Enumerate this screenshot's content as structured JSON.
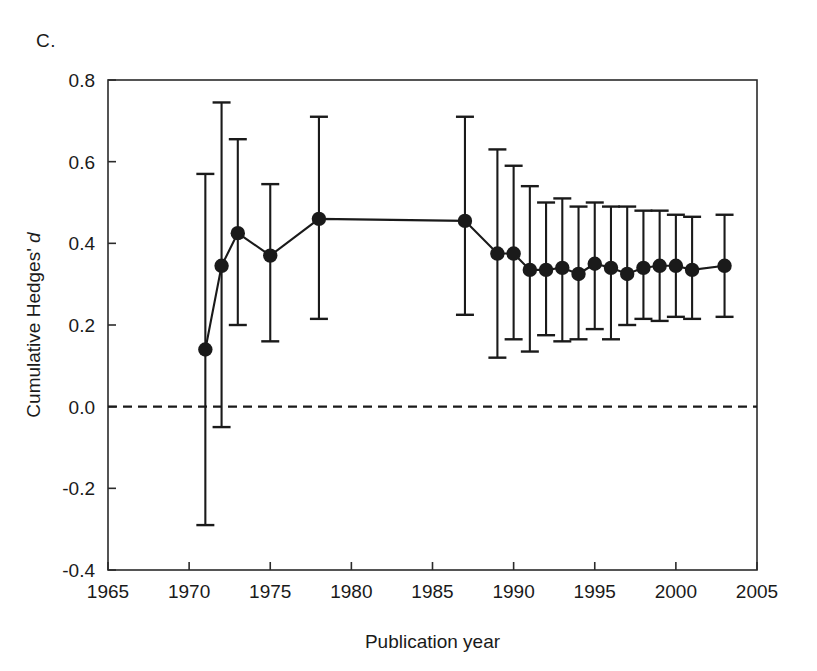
{
  "panel": {
    "label": "C."
  },
  "chart_data": {
    "type": "line",
    "title": "",
    "subtitle": "",
    "xlabel": "Publication year",
    "ylabel": "Cumulative Hedges' d",
    "ylabel_parts": {
      "plain": "Cumulative Hedges'",
      "italic": "d"
    },
    "xlim": [
      1965,
      2005
    ],
    "ylim": [
      -0.4,
      0.8
    ],
    "xticks": [
      1965,
      1970,
      1975,
      1980,
      1985,
      1990,
      1995,
      2000,
      2005
    ],
    "xtick_labels": [
      "1965",
      "1970",
      "1975",
      "1980",
      "1985",
      "1990",
      "1995",
      "2000",
      "2005"
    ],
    "yticks": [
      -0.4,
      -0.2,
      0.0,
      0.2,
      0.4,
      0.6,
      0.8
    ],
    "ytick_labels": [
      "-0.4",
      "-0.2",
      "0.0",
      "0.2",
      "0.4",
      "0.6",
      "0.8"
    ],
    "grid": false,
    "legend": null,
    "reference_line": {
      "y": 0.0,
      "style": "dashed",
      "color": "#1a1a1a"
    },
    "marker": "filled-circle",
    "error_bars": "95% confidence interval",
    "series": [
      {
        "name": "Cumulative Hedges' d",
        "color": "#1a1a1a",
        "x": [
          1971,
          1972,
          1973,
          1975,
          1978,
          1987,
          1989,
          1990,
          1991,
          1992,
          1993,
          1994,
          1995,
          1996,
          1997,
          1998,
          1999,
          2000,
          2001,
          2003
        ],
        "values": [
          0.14,
          0.345,
          0.425,
          0.37,
          0.46,
          0.455,
          0.375,
          0.375,
          0.335,
          0.335,
          0.34,
          0.325,
          0.35,
          0.34,
          0.325,
          0.34,
          0.345,
          0.345,
          0.335,
          0.345
        ],
        "ci_lower": [
          -0.29,
          -0.05,
          0.2,
          0.16,
          0.215,
          0.225,
          0.12,
          0.165,
          0.135,
          0.175,
          0.16,
          0.165,
          0.19,
          0.165,
          0.2,
          0.215,
          0.21,
          0.22,
          0.215,
          0.22
        ],
        "ci_upper": [
          0.57,
          0.745,
          0.655,
          0.545,
          0.71,
          0.71,
          0.63,
          0.59,
          0.54,
          0.5,
          0.51,
          0.49,
          0.5,
          0.49,
          0.49,
          0.48,
          0.48,
          0.47,
          0.465,
          0.47
        ]
      }
    ]
  }
}
